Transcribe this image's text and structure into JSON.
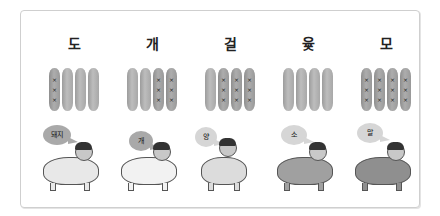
{
  "panel": {
    "columns": [
      {
        "title": "도",
        "sticks_marked": [
          true,
          false,
          false,
          false
        ],
        "bubble": "돼지",
        "animal": "pig",
        "animal_color": "#e8e8e8",
        "bubble_color": "#a9a9a9"
      },
      {
        "title": "개",
        "sticks_marked": [
          false,
          false,
          true,
          true
        ],
        "bubble": "개",
        "animal": "dog",
        "animal_color": "#f2f2f2",
        "bubble_color": "#a9a9a9"
      },
      {
        "title": "걸",
        "sticks_marked": [
          false,
          true,
          true,
          true
        ],
        "bubble": "양",
        "animal": "sheep",
        "animal_color": "#dcdcdc",
        "bubble_color": "#d6d6d6"
      },
      {
        "title": "윷",
        "sticks_marked": [
          false,
          false,
          false,
          false
        ],
        "bubble": "소",
        "animal": "cow",
        "animal_color": "#a0a0a0",
        "bubble_color": "#d6d6d6"
      },
      {
        "title": "모",
        "sticks_marked": [
          true,
          true,
          true,
          true
        ],
        "bubble": "말",
        "animal": "horse",
        "animal_color": "#8f8f8f",
        "bubble_color": "#d6d6d6"
      }
    ]
  },
  "colors": {
    "stick": "#ababab",
    "border": "#cfcfcf",
    "text": "#222222"
  }
}
